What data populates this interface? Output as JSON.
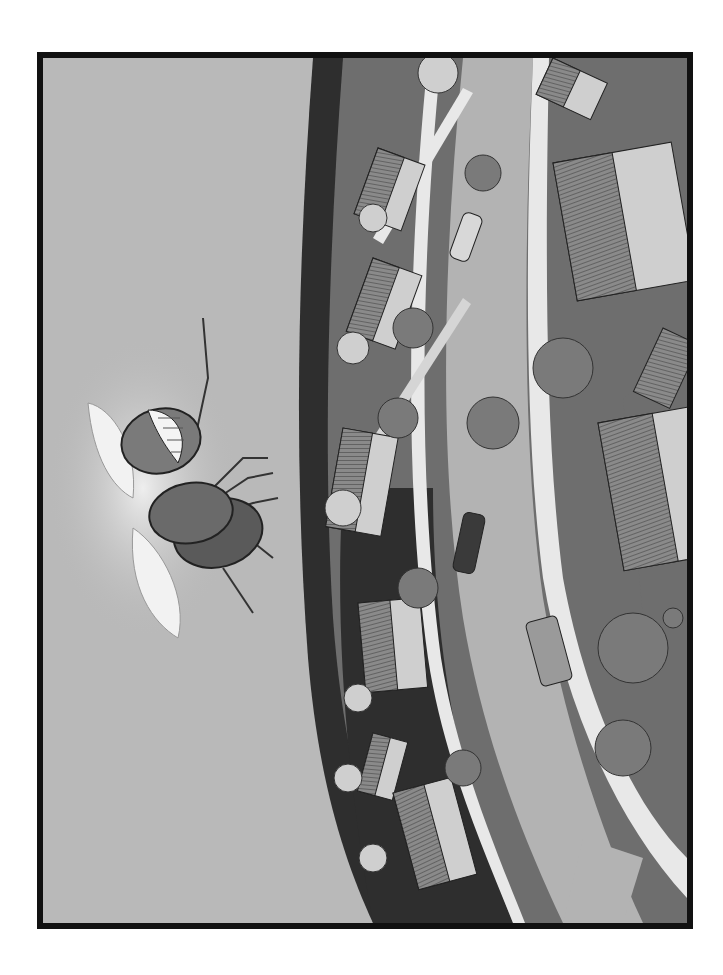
{
  "illustration": {
    "description": "Grayscale illustration of a cartoon fly viewed from above, flying over a curved suburban neighborhood with houses, trees, roads and cars",
    "frame": {
      "border_color": "#111111",
      "sky_color": "#b9b9b9"
    },
    "colors": {
      "paper": "#b9b9b9",
      "lawn": "#6e6e6e",
      "dark_lawn": "#2e2e2e",
      "road": "#b3b3b3",
      "sidewalk": "#e8e8e8",
      "tree": "#7a7a7a",
      "light_tree": "#cfcfcf",
      "roof": "#8a8a8a",
      "wall": "#cfcfcf",
      "fly_body": "#6a6a6a",
      "wing": "#f2f2f2"
    },
    "subject": {
      "name": "fly",
      "features": [
        "smiling mouth with teeth",
        "two translucent wings",
        "six legs"
      ]
    },
    "scene_elements": {
      "houses": 9,
      "cars": 3,
      "trees": 12,
      "roads": 2
    }
  }
}
